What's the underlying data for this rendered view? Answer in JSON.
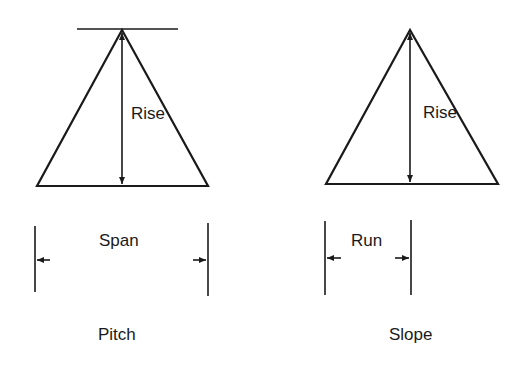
{
  "diagrams": [
    {
      "name": "pitch",
      "caption": "Pitch",
      "rise_label": "Rise",
      "width_label": "Span",
      "has_top_line": true
    },
    {
      "name": "slope",
      "caption": "Slope",
      "rise_label": "Rise",
      "width_label": "Run",
      "has_top_line": false
    }
  ],
  "colors": {
    "line": "#1a1a1a",
    "background": "#ffffff"
  }
}
